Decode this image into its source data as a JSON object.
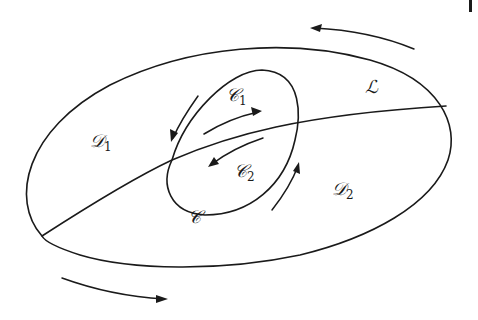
{
  "diagram": {
    "type": "domain-decomposition",
    "stroke_color": "#1a1a1a",
    "background": "#ffffff",
    "labels": {
      "D1": {
        "main": "𝒟",
        "sub": "1"
      },
      "D2": {
        "main": "𝒟",
        "sub": "2"
      },
      "C1": {
        "main": "𝒞",
        "sub": "1"
      },
      "C2": {
        "main": "𝒞",
        "sub": "2"
      },
      "C": {
        "main": "𝒞",
        "sub": ""
      },
      "L": {
        "main": "ℒ",
        "sub": ""
      }
    },
    "shapes": [
      {
        "name": "outer-ellipse",
        "description": "large tilted ellipse bounding D1 and D2"
      },
      {
        "name": "inner-ellipse",
        "description": "curve C enclosing C1 and C2"
      },
      {
        "name": "line-L",
        "description": "curve L dividing D1 from D2"
      }
    ],
    "arrows": [
      {
        "name": "top-right-arrow",
        "direction": "counterclockwise-left"
      },
      {
        "name": "bottom-left-arrow",
        "direction": "right"
      },
      {
        "name": "inner-left-arrow",
        "direction": "down-left"
      },
      {
        "name": "inner-c1-arrow",
        "direction": "right"
      },
      {
        "name": "inner-c2-arrow",
        "direction": "left"
      },
      {
        "name": "inner-right-arrow",
        "direction": "up-right"
      }
    ]
  }
}
